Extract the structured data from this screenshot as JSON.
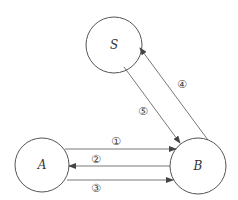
{
  "diagram": {
    "nodes": [
      {
        "id": "S",
        "label": "S"
      },
      {
        "id": "A",
        "label": "A"
      },
      {
        "id": "B",
        "label": "B"
      }
    ],
    "edges": [
      {
        "from": "A",
        "to": "B",
        "label": "①"
      },
      {
        "from": "B",
        "to": "A",
        "label": "②"
      },
      {
        "from": "A",
        "to": "B",
        "label": "③"
      },
      {
        "from": "B",
        "to": "S",
        "label": "④"
      },
      {
        "from": "S",
        "to": "B",
        "label": "⑤"
      }
    ]
  }
}
